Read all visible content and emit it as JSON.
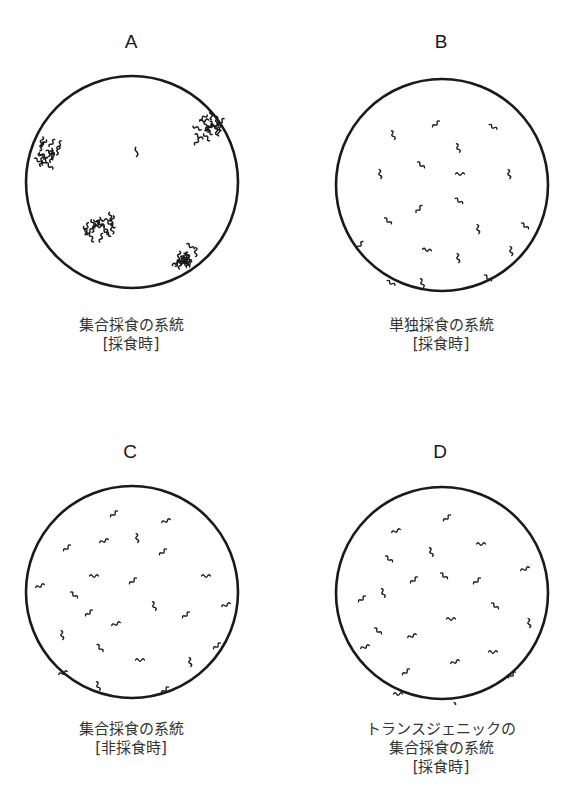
{
  "panels": [
    {
      "id": "A",
      "caption_line1": "集合採食の系統",
      "caption_line2": "[採食時]",
      "caption_line3": "",
      "distribution": "clustered"
    },
    {
      "id": "B",
      "caption_line1": "単独採食の系統",
      "caption_line2": "[採食時]",
      "caption_line3": "",
      "distribution": "dispersed"
    },
    {
      "id": "C",
      "caption_line1": "集合採食の系統",
      "caption_line2": "[非採食時]",
      "caption_line3": "",
      "distribution": "dispersed"
    },
    {
      "id": "D",
      "caption_line1": "トランスジェニックの",
      "caption_line2": "集合採食の系統",
      "caption_line3": "[採食時]",
      "distribution": "dispersed"
    }
  ],
  "colors": {
    "stroke": "#1a1a1a",
    "background": "#ffffff"
  }
}
